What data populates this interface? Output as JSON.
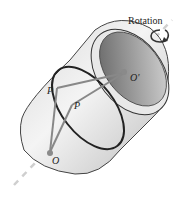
{
  "diagram": {
    "title": "",
    "labels": {
      "rotation": "Rotation",
      "p_upper": "P",
      "p_lower": "P",
      "o_prime": "O'",
      "o": "O"
    },
    "colors": {
      "body_light": "#f2f2f2",
      "body_dark": "#9a9a9a",
      "rim_inner": "#6e6e6e",
      "outline": "#333333",
      "axis": "#c8c8c8",
      "chord": "#888888",
      "point": "#888888",
      "ring": "#222222"
    }
  }
}
